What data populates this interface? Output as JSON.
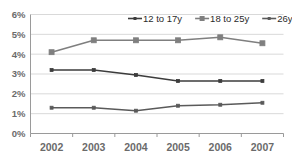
{
  "chart_data": {
    "type": "line",
    "title": "",
    "subtitle": "",
    "xlabel": "",
    "ylabel": "",
    "categories": [
      "2002",
      "2003",
      "2004",
      "2005",
      "2006",
      "2007"
    ],
    "x": [
      2002,
      2003,
      2004,
      2005,
      2006,
      2007
    ],
    "ylim": [
      0,
      6
    ],
    "yticks": [
      0,
      1,
      2,
      3,
      4,
      5,
      6
    ],
    "ytick_labels": [
      "0%",
      "1%",
      "2%",
      "3%",
      "4%",
      "5%",
      "6%"
    ],
    "xtick_labels": [
      "2002",
      "2003",
      "2004",
      "2005",
      "2006",
      "2007"
    ],
    "grid": true,
    "grid_axis": "y",
    "legend_position": "top-right",
    "value_suffix": "%",
    "series": [
      {
        "name": "12 to 17y",
        "values": [
          3.2,
          3.2,
          2.95,
          2.65,
          2.65,
          2.65
        ],
        "color": "#3c3c3c",
        "marker": "square",
        "marker_size": 3
      },
      {
        "name": "18 to 25y",
        "values": [
          4.1,
          4.7,
          4.7,
          4.7,
          4.85,
          4.55
        ],
        "color": "#7f7f7f",
        "marker": "square",
        "marker_size": 5
      },
      {
        "name": "26y & >",
        "values": [
          1.3,
          1.3,
          1.15,
          1.4,
          1.45,
          1.55
        ],
        "color": "#5a5a5a",
        "marker": "square",
        "marker_size": 3
      }
    ]
  },
  "legend": {
    "items": [
      {
        "label": "12 to 17y"
      },
      {
        "label": "18 to 25y"
      },
      {
        "label": "26y & >"
      }
    ]
  },
  "axes": {
    "y_labels": [
      "6%",
      "5%",
      "4%",
      "3%",
      "2%",
      "1%",
      "0%"
    ],
    "x_labels": [
      "2002",
      "2003",
      "2004",
      "2005",
      "2006",
      "2007"
    ]
  },
  "colors": {
    "background": "#ffffff",
    "grid": "#d9d9d9",
    "axis": "#9a9a9a",
    "tick_text": "#6b6b6b",
    "legend_text": "#2a2a2a",
    "series_1": "#3c3c3c",
    "series_2": "#7f7f7f",
    "series_3": "#5a5a5a"
  }
}
